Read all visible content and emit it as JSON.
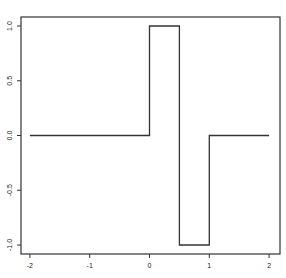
{
  "chart_data": {
    "type": "line",
    "title": "",
    "xlabel": "",
    "ylabel": "",
    "xlim": [
      -2.15,
      2.15
    ],
    "ylim": [
      -1.08,
      1.08
    ],
    "grid": false,
    "legend": null,
    "x_ticks": [
      -2,
      -1,
      0,
      1,
      2
    ],
    "x_tick_labels": [
      "-2",
      "-1",
      "0",
      "1",
      "2"
    ],
    "y_ticks": [
      -1.0,
      -0.5,
      0.0,
      0.5,
      1.0
    ],
    "y_tick_labels": [
      "-1.0",
      "-0.5",
      "0.0",
      "0.5",
      "1.0"
    ],
    "series": [
      {
        "name": "step function (Haar wavelet)",
        "style": "step",
        "color": "#333333",
        "x": [
          -2,
          0,
          0,
          0.5,
          0.5,
          1,
          1,
          2
        ],
        "y": [
          0,
          0,
          1,
          1,
          -1,
          -1,
          0,
          0
        ]
      }
    ]
  }
}
